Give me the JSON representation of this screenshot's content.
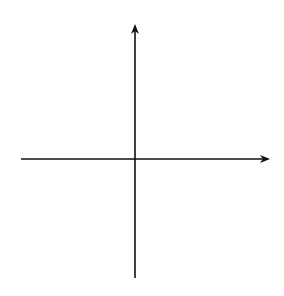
{
  "header": {
    "clipped_label": "y = f(x)"
  },
  "graph": {
    "x_axis_label": "x",
    "y_axis_label": "y",
    "grid": {
      "x_min": -5,
      "x_max": 5,
      "y_min": -5,
      "y_max": 5,
      "step": 1,
      "style": "dotted"
    },
    "curve": {
      "description": "logarithmic curve y = ln(x)",
      "x_intercept": [
        1,
        0
      ],
      "start_point": [
        0.15,
        -1.9
      ],
      "end_point": [
        5.5,
        1.7
      ],
      "arrows": "both ends"
    },
    "colors": {
      "grid": "#9a9a9a",
      "axes": "#111111",
      "curve": "#111111"
    }
  },
  "chart_data": {
    "type": "line",
    "title": "",
    "xlabel": "x",
    "ylabel": "y",
    "xlim": [
      -5,
      5
    ],
    "ylim": [
      -5,
      5
    ],
    "grid": true,
    "series": [
      {
        "name": "y = ln(x)",
        "x": [
          0.15,
          0.25,
          0.5,
          1,
          1.5,
          2,
          2.718,
          3,
          4,
          5,
          5.5
        ],
        "values": [
          -1.9,
          -1.39,
          -0.69,
          0,
          0.41,
          0.69,
          1,
          1.1,
          1.39,
          1.61,
          1.7
        ]
      }
    ]
  }
}
